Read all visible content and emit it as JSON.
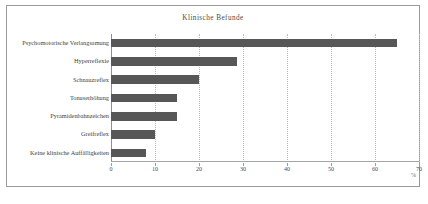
{
  "chart_data": {
    "type": "bar",
    "orientation": "horizontal",
    "title": "Klinische Befunde",
    "xlabel": "%",
    "ylabel": "",
    "categories": [
      "Psychomotorische Verlangsamung",
      "Hyperreflexie",
      "Schnauzreflex",
      "Tonuserhöhung",
      "Pyramidenbahnzeichen",
      "Greifreflex",
      "Keine klinische Auffälligkeiten"
    ],
    "values": [
      65,
      28.7,
      20,
      15,
      15,
      10,
      8
    ],
    "xlim": [
      0,
      70
    ],
    "xticks": [
      0,
      10,
      20,
      30,
      40,
      50,
      60,
      70
    ],
    "xtick_labels": [
      "0",
      "10",
      "20",
      "30",
      "40",
      "50",
      "60",
      "70"
    ],
    "grid": "vertical-dotted",
    "legend": "none",
    "bar_color": "#575757",
    "grid_color": "#b9b9b9",
    "axis_color": "#9b9b9b",
    "background": "#ffffff"
  },
  "figure": {
    "border_color": "#9a9a9a",
    "caption_cut": ""
  }
}
